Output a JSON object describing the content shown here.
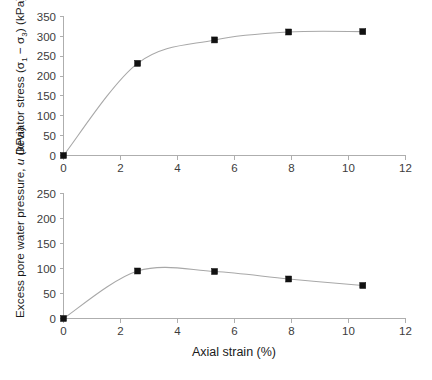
{
  "figure": {
    "background": "#ffffff",
    "line_color": "#a8a8a8",
    "marker_color": "#111111",
    "axis_color": "#aeaeae",
    "x_axis_label": "Axial strain (%)",
    "x_ticks": [
      "0",
      "2",
      "4",
      "6",
      "8",
      "10",
      "12"
    ]
  },
  "chart_data": [
    {
      "type": "line",
      "title": "",
      "panel": "top",
      "xlabel": "Axial strain (%)",
      "ylabel": "Deviator stress (σ₁ − σ₃) (kPa)",
      "ylabel_parts": {
        "prefix": "Deviator stress (",
        "sigma": "σ",
        "sub1": "1",
        "minus": " − ",
        "sub3": "3",
        "suffix": ") (kPa)"
      },
      "xlim": [
        0,
        12
      ],
      "ylim": [
        0,
        350
      ],
      "xticks": [
        0,
        2,
        4,
        6,
        8,
        10,
        12
      ],
      "yticks": [
        0,
        50,
        100,
        150,
        200,
        250,
        300,
        350
      ],
      "xtick_labels": [
        "0",
        "2",
        "4",
        "6",
        "8",
        "10",
        "12"
      ],
      "ytick_labels": [
        "0",
        "50",
        "100",
        "150",
        "200",
        "250",
        "300",
        "350"
      ],
      "grid": false,
      "legend": "none",
      "marker": "square",
      "x": [
        0,
        2.6,
        5.3,
        7.9,
        10.5
      ],
      "values": [
        0,
        232,
        291,
        311,
        312
      ],
      "series": [
        {
          "name": "Deviator stress",
          "points": [
            {
              "x": 0,
              "y": 0
            },
            {
              "x": 2.6,
              "y": 232
            },
            {
              "x": 5.3,
              "y": 291
            },
            {
              "x": 7.9,
              "y": 311
            },
            {
              "x": 10.5,
              "y": 312
            }
          ]
        }
      ]
    },
    {
      "type": "line",
      "title": "",
      "panel": "bottom",
      "xlabel": "Axial strain (%)",
      "ylabel": "Excess pore water pressure, u (kPa)",
      "ylabel_parts": {
        "prefix": "Excess pore water pressure, ",
        "italic": "u",
        "suffix": " (kPa)"
      },
      "xlim": [
        0,
        12
      ],
      "ylim": [
        0,
        250
      ],
      "xticks": [
        0,
        2,
        4,
        6,
        8,
        10,
        12
      ],
      "yticks": [
        0,
        50,
        100,
        150,
        200,
        250
      ],
      "xtick_labels": [
        "0",
        "2",
        "4",
        "6",
        "8",
        "10",
        "12"
      ],
      "ytick_labels": [
        "0",
        "50",
        "100",
        "150",
        "200",
        "250"
      ],
      "grid": false,
      "legend": "none",
      "marker": "square",
      "x": [
        0,
        2.6,
        5.3,
        7.9,
        10.5
      ],
      "values": [
        0,
        95,
        94,
        79,
        66
      ],
      "series": [
        {
          "name": "Excess pore water pressure",
          "points": [
            {
              "x": 0,
              "y": 0
            },
            {
              "x": 2.6,
              "y": 95
            },
            {
              "x": 5.3,
              "y": 94
            },
            {
              "x": 7.9,
              "y": 79
            },
            {
              "x": 10.5,
              "y": 66
            }
          ]
        }
      ]
    }
  ]
}
